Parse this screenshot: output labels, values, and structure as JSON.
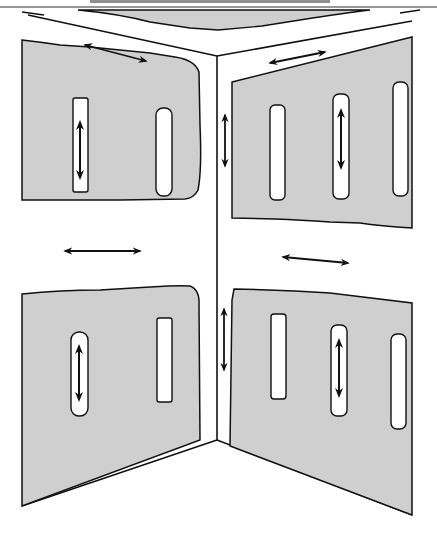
{
  "figure": {
    "type": "corner-wall-diagram",
    "colors": {
      "panel_fill": "#cfcfcf",
      "line": "#111111",
      "background": "#ffffff"
    },
    "walls": [
      {
        "name": "left-wall",
        "panels": [
          {
            "name": "upper-left-panel",
            "slots": 2,
            "slot_with_arrow": 1
          },
          {
            "name": "lower-left-panel",
            "slots": 2,
            "slot_with_arrow": 1
          }
        ]
      },
      {
        "name": "right-wall",
        "panels": [
          {
            "name": "upper-right-panel",
            "slots": 3,
            "slot_with_arrow": 2
          },
          {
            "name": "lower-right-panel",
            "slots": 3,
            "slot_with_arrow": 2
          }
        ]
      }
    ],
    "arrows": [
      {
        "name": "ceiling-left-arrow",
        "direction": "horizontal"
      },
      {
        "name": "ceiling-right-arrow",
        "direction": "horizontal"
      },
      {
        "name": "mid-left-arrow",
        "direction": "horizontal"
      },
      {
        "name": "mid-right-arrow",
        "direction": "horizontal"
      },
      {
        "name": "corner-upper-arrow",
        "direction": "vertical"
      },
      {
        "name": "corner-lower-arrow",
        "direction": "vertical"
      },
      {
        "name": "slot-arrow-upper-left",
        "direction": "vertical"
      },
      {
        "name": "slot-arrow-upper-right",
        "direction": "vertical"
      },
      {
        "name": "slot-arrow-lower-left",
        "direction": "vertical"
      },
      {
        "name": "slot-arrow-lower-right",
        "direction": "vertical"
      }
    ]
  }
}
